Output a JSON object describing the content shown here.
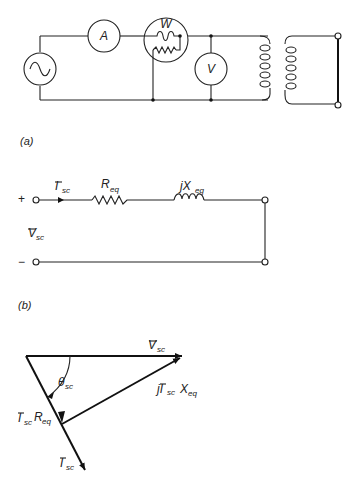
{
  "figure": {
    "part_a": {
      "caption": "(a)",
      "meters": {
        "ammeter": "A",
        "wattmeter": "W",
        "voltmeter": "V"
      },
      "source": "ac-source-icon",
      "transformer": "transformer-windings"
    },
    "part_b_circuit": {
      "plus": "+",
      "minus": "−",
      "current_label": "I",
      "current_sub": "sc",
      "voltage_label": "V",
      "voltage_sub": "sc",
      "resistor_label": "R",
      "resistor_sub": "eq",
      "reactance_label": "jX",
      "reactance_sub": "eq"
    },
    "part_b": {
      "caption": "(b)",
      "phasor_v": "V",
      "phasor_v_sub": "sc",
      "angle": "θ",
      "angle_sub": "sc",
      "ir_drop_main": "I",
      "ir_drop_sub1": "sc",
      "ir_drop_main2": "R",
      "ir_drop_sub2": "eq",
      "jix_main": "jI",
      "jix_sub1": "sc",
      "jix_main2": "X",
      "jix_sub2": "eq",
      "phasor_i": "I",
      "phasor_i_sub": "sc"
    }
  }
}
